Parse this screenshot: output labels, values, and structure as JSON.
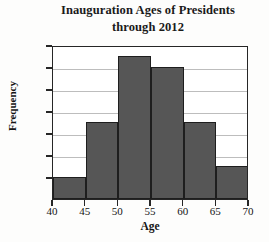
{
  "chart_data": {
    "type": "bar",
    "title": "Inauguration Ages of Presidents through 2012",
    "title_line1": "Inauguration Ages of Presidents",
    "title_line2": "through 2012",
    "xlabel": "Age",
    "ylabel": "Frequency",
    "categories": [
      "40-45",
      "45-50",
      "50-55",
      "55-60",
      "60-65",
      "65-70"
    ],
    "bin_edges": [
      40,
      45,
      50,
      55,
      60,
      65,
      70
    ],
    "values": [
      2,
      7,
      13,
      12,
      7,
      3
    ],
    "xlim": [
      40,
      70
    ],
    "ylim": [
      0,
      14
    ],
    "x_ticks": [
      40,
      45,
      50,
      55,
      60,
      65,
      70
    ],
    "y_ticks": [
      2,
      4,
      6,
      8,
      10,
      12,
      14
    ],
    "grid": true,
    "legend": null,
    "bar_color": "#565656",
    "bar_edge_color": "#1e1e1e",
    "grid_color": "#bdbdbd",
    "axis_color": "#262626",
    "background": "#fdfdfc"
  }
}
